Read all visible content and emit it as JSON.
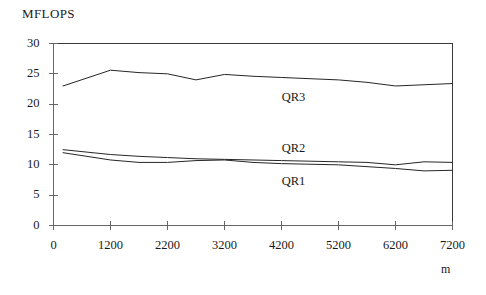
{
  "chart_data": {
    "type": "line",
    "title": "",
    "ylabel": "MFLOPS",
    "xlabel": "m",
    "xlim": [
      0,
      7200
    ],
    "ylim": [
      0,
      30
    ],
    "grid": false,
    "legend_position": "inline-annotations",
    "yticks": [
      0,
      5,
      10,
      15,
      20,
      25,
      30
    ],
    "ytick_labels": [
      "0",
      "5",
      "10",
      "15",
      "20",
      "25",
      "30"
    ],
    "xticks": [
      0,
      1200,
      2200,
      3200,
      4200,
      5200,
      6200,
      7200
    ],
    "xtick_labels": [
      "0",
      "1200",
      "2200",
      "3200",
      "4200",
      "5200",
      "6200",
      "7200"
    ],
    "x": [
      200,
      1200,
      1700,
      2200,
      2700,
      3200,
      3700,
      4200,
      4700,
      5200,
      5700,
      6200,
      6700,
      7200
    ],
    "series": [
      {
        "name": "QR3",
        "label": "QR3",
        "color": "#262626",
        "values": [
          23.0,
          25.6,
          25.2,
          25.0,
          24.0,
          24.9,
          24.6,
          24.4,
          24.2,
          24.0,
          23.6,
          23.0,
          23.2,
          23.4
        ]
      },
      {
        "name": "QR2",
        "label": "QR2",
        "color": "#262626",
        "values": [
          12.5,
          11.7,
          11.4,
          11.2,
          11.0,
          10.9,
          10.8,
          10.7,
          10.6,
          10.5,
          10.4,
          10.0,
          10.5,
          10.4
        ]
      },
      {
        "name": "QR1",
        "label": "QR1",
        "color": "#262626",
        "values": [
          12.0,
          10.8,
          10.4,
          10.4,
          10.7,
          10.8,
          10.4,
          10.2,
          10.1,
          10.0,
          9.7,
          9.4,
          9.0,
          9.1
        ]
      }
    ],
    "annotations": [
      {
        "text": "QR3",
        "x": 4450,
        "y": 21.0
      },
      {
        "text": "QR2",
        "x": 4450,
        "y": 12.6
      },
      {
        "text": "QR1",
        "x": 4450,
        "y": 7.1
      }
    ]
  }
}
